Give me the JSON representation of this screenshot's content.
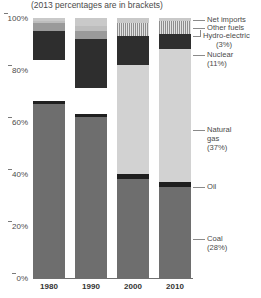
{
  "chart_data": {
    "type": "bar",
    "title": "(2013 percentages are in brackets)",
    "xlabel": "",
    "ylabel": "",
    "ylim": [
      0,
      100
    ],
    "stacked": true,
    "normalized_percent": true,
    "grid": false,
    "legend_position": "right-callouts",
    "categories": [
      "1980",
      "1990",
      "2000",
      "2010"
    ],
    "series": [
      {
        "name": "Coal",
        "bracket_label": "(28%)",
        "values": [
          67,
          62,
          38,
          35
        ]
      },
      {
        "name": "Oil",
        "bracket_label": "",
        "values": [
          1,
          1,
          2,
          2
        ]
      },
      {
        "name": "Natural gas",
        "bracket_label": "(37%)",
        "values": [
          16,
          10,
          42,
          51
        ]
      },
      {
        "name": "Nuclear",
        "bracket_label": "(11%)",
        "values": [
          11,
          19,
          11,
          6
        ]
      },
      {
        "name": "Hydro-electric",
        "bracket_label": "(3%)",
        "values": [
          3,
          3,
          3,
          3
        ]
      },
      {
        "name": "Other fuels",
        "bracket_label": "",
        "values": [
          1,
          2,
          2,
          2
        ]
      },
      {
        "name": "Net imports",
        "bracket_label": "",
        "values": [
          1,
          3,
          2,
          1
        ]
      }
    ],
    "yticks": [
      "0%",
      "20%",
      "40%",
      "60%",
      "80%",
      "100%"
    ],
    "ytick_values": [
      0,
      20,
      40,
      60,
      80,
      100
    ]
  },
  "legend": {
    "net_imports": {
      "label": "Net imports",
      "pct": ""
    },
    "other_fuels": {
      "label": "Other fuels",
      "pct": ""
    },
    "hydro": {
      "label": "Hydro-electric",
      "pct": "(3%)"
    },
    "nuclear": {
      "label": "Nuclear",
      "pct": "(11%)"
    },
    "natural_gas_1": {
      "label": "Natural",
      "pct": ""
    },
    "natural_gas_2": {
      "label": "gas",
      "pct": "(37%)"
    },
    "oil": {
      "label": "Oil",
      "pct": ""
    },
    "coal": {
      "label": "Coal",
      "pct": "(28%)"
    }
  },
  "colors": {
    "coal": "#6e6e6e",
    "oil": "#1f1f1f",
    "natural_gas": "#ffffff",
    "nuclear": "#2e2e2e",
    "hydro": "#9a9a9a",
    "other_fuels": "#bdbdbd",
    "net_imports": "#c9c9c9",
    "axis": "#6f6f6f",
    "text": "#4a4a4a"
  }
}
